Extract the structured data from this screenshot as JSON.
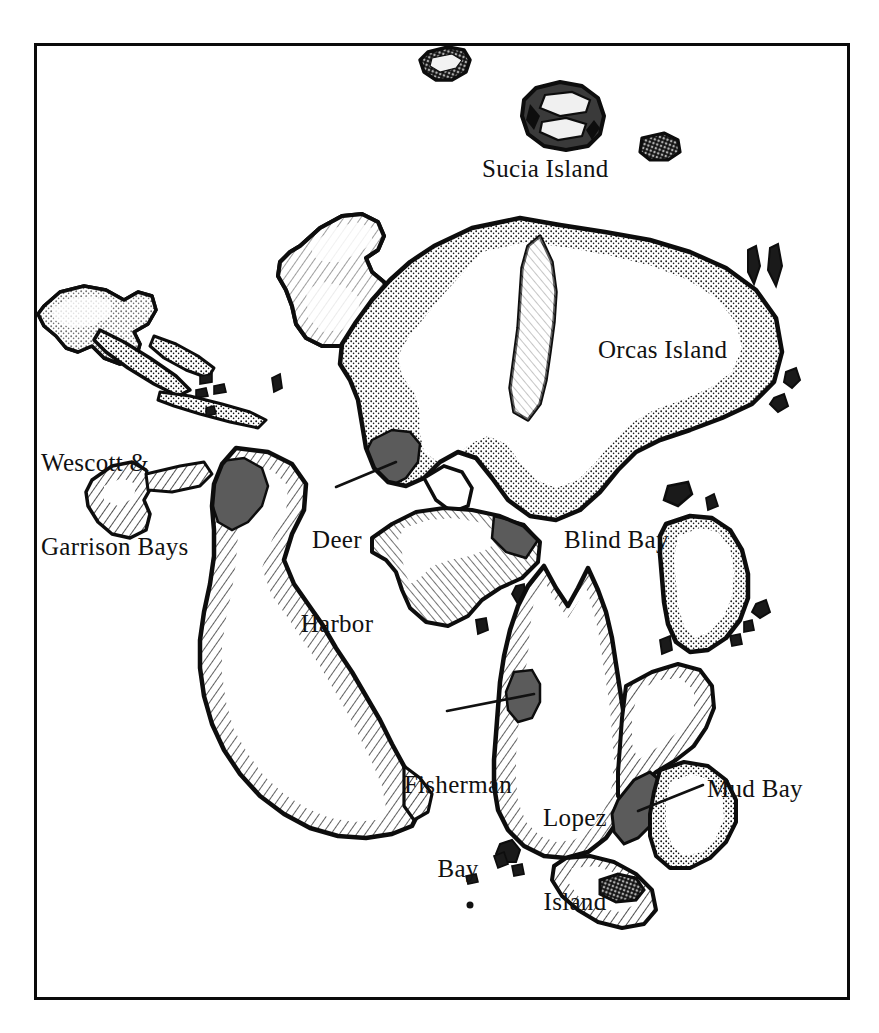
{
  "document": {
    "kind": "map",
    "title": "San Juan Islands",
    "style": "hand-drawn pen-and-ink chart",
    "background_color": "#ffffff",
    "frame_color": "#0a0a0a",
    "ink_color": "#111111",
    "bay_fill_color": "#5b5b5b"
  },
  "frame": {
    "x": 34,
    "y": 43,
    "width": 816,
    "height": 957,
    "stroke_width": 3
  },
  "labels": [
    {
      "id": "sucia-island",
      "text": "Sucia Island",
      "lines": [
        "Sucia Island"
      ],
      "x": 482,
      "y": 155,
      "align": "left",
      "leader": false
    },
    {
      "id": "orcas-island",
      "text": "Orcas Island",
      "lines": [
        "Orcas Island"
      ],
      "x": 598,
      "y": 336,
      "align": "left",
      "leader": false
    },
    {
      "id": "wescott-garrison",
      "text": "Wescott & Garrison Bays",
      "lines": [
        "Wescott &",
        "Garrison Bays"
      ],
      "x": 41,
      "y": 393,
      "align": "left",
      "leader": false
    },
    {
      "id": "deer-harbor",
      "text": "Deer Harbor",
      "lines": [
        "Deer",
        "Harbor"
      ],
      "x": 287,
      "y": 470,
      "align": "left",
      "leader": true
    },
    {
      "id": "blind-bay",
      "text": "Blind Bay",
      "lines": [
        "Blind Bay"
      ],
      "x": 564,
      "y": 526,
      "align": "left",
      "leader": false
    },
    {
      "id": "fisherman-bay",
      "text": "Fisherman Bay",
      "lines": [
        "Fisherman",
        "Bay"
      ],
      "x": 396,
      "y": 715,
      "align": "center",
      "leader": true
    },
    {
      "id": "lopez-island",
      "text": "Lopez Island",
      "lines": [
        "Lopez",
        "Island"
      ],
      "x": 528,
      "y": 748,
      "align": "center",
      "leader": false
    },
    {
      "id": "mud-bay",
      "text": "Mud Bay",
      "lines": [
        "Mud Bay"
      ],
      "x": 707,
      "y": 775,
      "align": "left",
      "leader": true
    }
  ],
  "leader_lines": [
    {
      "id": "deer-harbor-leader",
      "from": [
        336,
        487
      ],
      "to": [
        396,
        462
      ]
    },
    {
      "id": "fisherman-bay-leader",
      "from": [
        447,
        711
      ],
      "to": [
        534,
        694
      ]
    },
    {
      "id": "mud-bay-leader",
      "from": [
        703,
        785
      ],
      "to": [
        638,
        811
      ]
    }
  ],
  "islands": [
    {
      "id": "sucia-island",
      "name": "Sucia Island",
      "label": "sucia-island",
      "fill": "dark"
    },
    {
      "id": "matia-island",
      "name": "Matia Island",
      "label": null,
      "fill": "dark"
    },
    {
      "id": "clark-island",
      "name": "Clark Island",
      "label": null,
      "fill": "dark"
    },
    {
      "id": "orcas-island",
      "name": "Orcas Island",
      "label": "orcas-island",
      "fill": "hachure"
    },
    {
      "id": "waldron-island",
      "name": "Waldron Island",
      "label": null,
      "fill": "hachure"
    },
    {
      "id": "stuart-island",
      "name": "Stuart Island",
      "label": null,
      "fill": "hachure"
    },
    {
      "id": "johns-island",
      "name": "Johns Island",
      "label": null,
      "fill": "hachure"
    },
    {
      "id": "spieden-island",
      "name": "Spieden Island",
      "label": null,
      "fill": "hachure"
    },
    {
      "id": "san-juan-island",
      "name": "San Juan Island",
      "label": "wescott-garrison",
      "fill": "hachure"
    },
    {
      "id": "shaw-island",
      "name": "Shaw Island",
      "label": "blind-bay",
      "fill": "hachure"
    },
    {
      "id": "lopez-island",
      "name": "Lopez Island",
      "label": "lopez-island",
      "fill": "hachure"
    },
    {
      "id": "blakely-island",
      "name": "Blakely Island",
      "label": null,
      "fill": "hachure"
    },
    {
      "id": "decatur-island",
      "name": "Decatur Island",
      "label": null,
      "fill": "hachure"
    },
    {
      "id": "cypress-island",
      "name": "Cypress Island",
      "label": null,
      "fill": "hachure"
    }
  ],
  "bays": [
    {
      "id": "wescott-garrison-bays",
      "name": "Wescott & Garrison Bays",
      "island": "san-juan-island",
      "filled": true
    },
    {
      "id": "deer-harbor",
      "name": "Deer Harbor",
      "island": "orcas-island",
      "filled": true
    },
    {
      "id": "blind-bay",
      "name": "Blind Bay",
      "island": "shaw-island",
      "filled": true
    },
    {
      "id": "fisherman-bay",
      "name": "Fisherman Bay",
      "island": "lopez-island",
      "filled": true
    },
    {
      "id": "mud-bay",
      "name": "Mud Bay",
      "island": "lopez-island",
      "filled": true
    }
  ]
}
